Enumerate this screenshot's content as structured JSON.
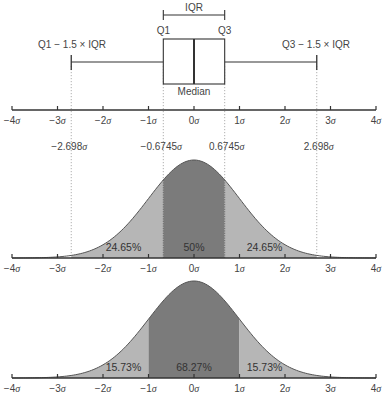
{
  "chart_data": [
    {
      "type": "boxplot",
      "title": "",
      "labels": {
        "iqr": "IQR",
        "q1": "Q1",
        "q3": "Q3",
        "median": "Median",
        "lower_fence": "Q1 − 1.5 × IQR",
        "upper_fence": "Q3 − 1.5 × IQR"
      },
      "values": {
        "lower_whisker": -2.698,
        "q1": -0.6745,
        "median": 0,
        "q3": 0.6745,
        "upper_whisker": 2.698
      },
      "xlim": [
        -4,
        4
      ],
      "x_tick_labels": [
        "−4σ",
        "−3σ",
        "−2σ",
        "−1σ",
        "0σ",
        "1σ",
        "2σ",
        "3σ",
        "4σ"
      ]
    },
    {
      "type": "area",
      "description": "Standard normal density with IQR regions shaded",
      "boundaries": [
        -0.6745,
        0.6745
      ],
      "markers": [
        {
          "x": -2.698,
          "label": "−2.698σ"
        },
        {
          "x": -0.6745,
          "label": "−0.6745σ"
        },
        {
          "x": 0.6745,
          "label": "0.6745σ"
        },
        {
          "x": 2.698,
          "label": "2.698σ"
        }
      ],
      "regions": [
        {
          "from": -2.698,
          "to": -0.6745,
          "label": "24.65%",
          "shade": "light"
        },
        {
          "from": -0.6745,
          "to": 0.6745,
          "label": "50%",
          "shade": "dark"
        },
        {
          "from": 0.6745,
          "to": 2.698,
          "label": "24.65%",
          "shade": "light"
        }
      ],
      "xlim": [
        -4,
        4
      ],
      "x_tick_labels": [
        "−4σ",
        "−3σ",
        "−2σ",
        "−1σ",
        "0σ",
        "1σ",
        "2σ",
        "3σ",
        "4σ"
      ]
    },
    {
      "type": "area",
      "description": "Standard normal density with ±1σ region shaded",
      "boundaries": [
        -1,
        1
      ],
      "regions": [
        {
          "from": -4,
          "to": -1,
          "label": "15.73%",
          "shade": "light"
        },
        {
          "from": -1,
          "to": 1,
          "label": "68.27%",
          "shade": "dark"
        },
        {
          "from": 1,
          "to": 4,
          "label": "15.73%",
          "shade": "light"
        }
      ],
      "xlim": [
        -4,
        4
      ],
      "x_tick_labels": [
        "−4σ",
        "−3σ",
        "−2σ",
        "−1σ",
        "0σ",
        "1σ",
        "2σ",
        "3σ",
        "4σ"
      ]
    }
  ],
  "colors": {
    "axis": "#333333",
    "dark_fill": "#7b7b7b",
    "light_fill": "#b6b6b6",
    "curve_stroke": "#555555",
    "guide": "#9a9a9a",
    "text": "#444444"
  }
}
